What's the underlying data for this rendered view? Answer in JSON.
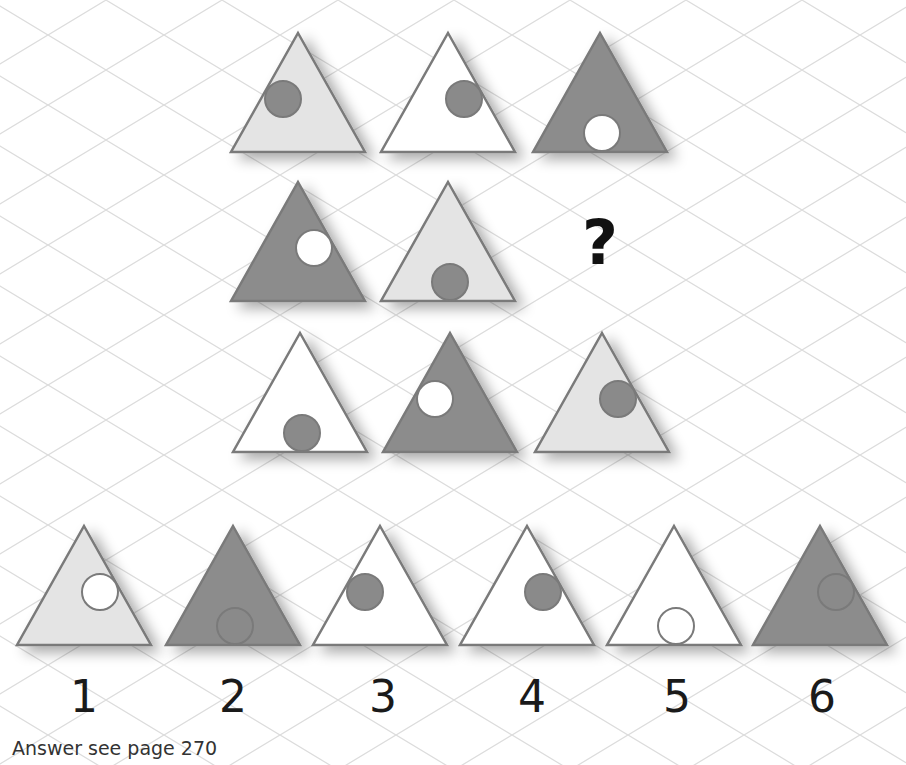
{
  "colors": {
    "dark_fill": "#8c8c8c",
    "light_fill": "#e4e4e4",
    "white_fill": "#ffffff",
    "stroke": "#7a7a7a",
    "circle_dark": "#8a8a8a",
    "circle_white": "#ffffff",
    "grid": "#dcdcdc"
  },
  "puzzle": {
    "grid": [
      [
        {
          "fill": "light",
          "circle": "dark",
          "circle_pos": "left"
        },
        {
          "fill": "white",
          "circle": "dark",
          "circle_pos": "right"
        },
        {
          "fill": "dark",
          "circle": "white",
          "circle_pos": "bottom"
        }
      ],
      [
        {
          "fill": "dark",
          "circle": "white",
          "circle_pos": "right"
        },
        {
          "fill": "light",
          "circle": "dark",
          "circle_pos": "bottom"
        },
        {
          "missing": true,
          "symbol": "?"
        }
      ],
      [
        {
          "fill": "white",
          "circle": "dark",
          "circle_pos": "bottom"
        },
        {
          "fill": "dark",
          "circle": "white",
          "circle_pos": "left"
        },
        {
          "fill": "light",
          "circle": "dark",
          "circle_pos": "right"
        }
      ]
    ],
    "options": [
      {
        "label": "1",
        "fill": "light",
        "circle": "white",
        "circle_pos": "right"
      },
      {
        "label": "2",
        "fill": "dark",
        "circle": "dark",
        "circle_pos": "bottom"
      },
      {
        "label": "3",
        "fill": "white",
        "circle": "dark",
        "circle_pos": "left"
      },
      {
        "label": "4",
        "fill": "white",
        "circle": "dark",
        "circle_pos": "right"
      },
      {
        "label": "5",
        "fill": "white",
        "circle": "white",
        "circle_pos": "bottom"
      },
      {
        "label": "6",
        "fill": "dark",
        "circle": "dark",
        "circle_pos": "right"
      }
    ]
  },
  "footer": {
    "answer_text": "Answer see page 270"
  }
}
